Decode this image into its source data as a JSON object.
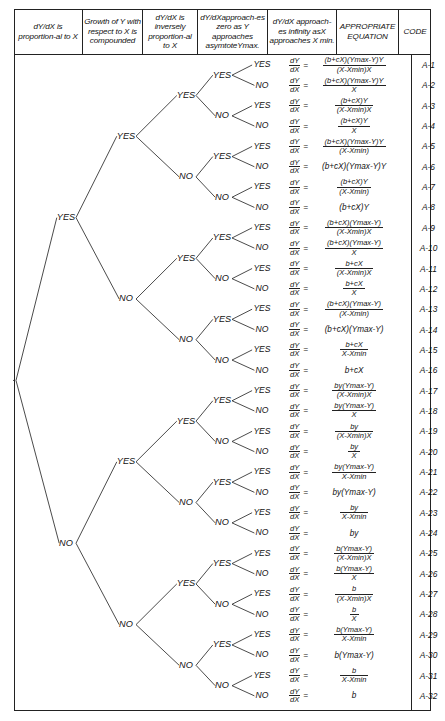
{
  "headers": [
    {
      "id": "col-proportional-to-x",
      "text": "dY/dX is proportion-al to X"
    },
    {
      "id": "col-compounded",
      "text": "Growth of Y with respect to X is compounded"
    },
    {
      "id": "col-inversely-proportional",
      "text": "dY/dX is inversely proportion-al to X"
    },
    {
      "id": "col-approaches-zero",
      "text": "dY/dXapproach-es zero as Y approaches asymtoteYmax."
    },
    {
      "id": "col-approaches-infinity",
      "text": "dY/dX approach-es infinity asX approaches X min."
    },
    {
      "id": "col-equation",
      "text": "APPROPRIATE EQUATION"
    },
    {
      "id": "col-code",
      "text": "CODE"
    }
  ],
  "labels": {
    "yes": "YES",
    "no": "NO",
    "dY": "dY",
    "dX": "dX",
    "equals": "="
  },
  "rows": [
    {
      "code": "A-1",
      "leaf": "YES",
      "eq": [
        {
          "t": "frac",
          "n": "(b+cX)(Ymax-Y)Y",
          "d": "(X-Xmin)X"
        }
      ]
    },
    {
      "code": "A-2",
      "leaf": "NO",
      "eq": [
        {
          "t": "frac",
          "n": "(b+cX)(Ymax-Y)Y",
          "d": "X"
        }
      ]
    },
    {
      "code": "A-3",
      "leaf": "YES",
      "eq": [
        {
          "t": "frac",
          "n": "(b+cX)Y",
          "d": "(X-Xmin)X"
        }
      ]
    },
    {
      "code": "A-4",
      "leaf": "NO",
      "eq": [
        {
          "t": "frac",
          "n": "(b+cX)Y",
          "d": "X"
        }
      ]
    },
    {
      "code": "A-5",
      "leaf": "YES",
      "eq": [
        {
          "t": "frac",
          "n": "(b+cX)(Ymax-Y)Y",
          "d": "(X-Xmin)"
        }
      ]
    },
    {
      "code": "A-6",
      "leaf": "NO",
      "eq": [
        {
          "t": "plain",
          "v": "(b+cX)(Ymax-Y)Y"
        }
      ]
    },
    {
      "code": "A-7",
      "leaf": "YES",
      "eq": [
        {
          "t": "frac",
          "n": "(b+cX)Y",
          "d": "(X-Xmin)"
        }
      ]
    },
    {
      "code": "A-8",
      "leaf": "NO",
      "eq": [
        {
          "t": "plain",
          "v": "(b+cX)Y"
        }
      ]
    },
    {
      "code": "A-9",
      "leaf": "YES",
      "eq": [
        {
          "t": "frac",
          "n": "(b+cX)(Ymax-Y)",
          "d": "(X-Xmin)X"
        }
      ]
    },
    {
      "code": "A-10",
      "leaf": "NO",
      "eq": [
        {
          "t": "frac",
          "n": "(b+cX)(Ymax-Y)",
          "d": "X"
        }
      ]
    },
    {
      "code": "A-11",
      "leaf": "YES",
      "eq": [
        {
          "t": "frac",
          "n": "b+cX",
          "d": "(X-Xmin)X"
        }
      ]
    },
    {
      "code": "A-12",
      "leaf": "NO",
      "eq": [
        {
          "t": "frac",
          "n": "b+cX",
          "d": "X"
        }
      ]
    },
    {
      "code": "A-13",
      "leaf": "YES",
      "eq": [
        {
          "t": "frac",
          "n": "(b+cX)(Ymax-Y)",
          "d": "(X-Xmin)"
        }
      ]
    },
    {
      "code": "A-14",
      "leaf": "NO",
      "eq": [
        {
          "t": "plain",
          "v": "(b+cX)(Ymax-Y)"
        }
      ]
    },
    {
      "code": "A-15",
      "leaf": "YES",
      "eq": [
        {
          "t": "frac",
          "n": "b+cX",
          "d": "X-Xmin"
        }
      ]
    },
    {
      "code": "A-16",
      "leaf": "NO",
      "eq": [
        {
          "t": "plain",
          "v": "b+cX"
        }
      ]
    },
    {
      "code": "A-17",
      "leaf": "YES",
      "eq": [
        {
          "t": "frac",
          "n": "by(Ymax-Y)",
          "d": "(X-Xmin)X"
        }
      ]
    },
    {
      "code": "A-18",
      "leaf": "NO",
      "eq": [
        {
          "t": "frac",
          "n": "by(Ymax-Y)",
          "d": "X"
        }
      ]
    },
    {
      "code": "A-19",
      "leaf": "YES",
      "eq": [
        {
          "t": "frac",
          "n": "by",
          "d": "(X-Xmin)X"
        }
      ]
    },
    {
      "code": "A-20",
      "leaf": "NO",
      "eq": [
        {
          "t": "frac",
          "n": "by",
          "d": "X"
        }
      ]
    },
    {
      "code": "A-21",
      "leaf": "YES",
      "eq": [
        {
          "t": "frac",
          "n": "by(Ymax-Y)",
          "d": "X-Xmin"
        }
      ]
    },
    {
      "code": "A-22",
      "leaf": "NO",
      "eq": [
        {
          "t": "plain",
          "v": "by(Ymax-Y)"
        }
      ]
    },
    {
      "code": "A-23",
      "leaf": "YES",
      "eq": [
        {
          "t": "frac",
          "n": "by",
          "d": "X-Xmin"
        }
      ]
    },
    {
      "code": "A-24",
      "leaf": "NO",
      "eq": [
        {
          "t": "plain",
          "v": "by"
        }
      ]
    },
    {
      "code": "A-25",
      "leaf": "YES",
      "eq": [
        {
          "t": "frac",
          "n": "b(Ymax-Y)",
          "d": "(X-Xmin)X"
        }
      ]
    },
    {
      "code": "A-26",
      "leaf": "NO",
      "eq": [
        {
          "t": "frac",
          "n": "b(Ymax-Y)",
          "d": "X"
        }
      ]
    },
    {
      "code": "A-27",
      "leaf": "YES",
      "eq": [
        {
          "t": "frac",
          "n": "b",
          "d": "(X-Xmin)X"
        }
      ]
    },
    {
      "code": "A-28",
      "leaf": "NO",
      "eq": [
        {
          "t": "frac",
          "n": "b",
          "d": "X"
        }
      ]
    },
    {
      "code": "A-29",
      "leaf": "YES",
      "eq": [
        {
          "t": "frac",
          "n": "b(Ymax-Y)",
          "d": "X-Xmin"
        }
      ]
    },
    {
      "code": "A-30",
      "leaf": "NO",
      "eq": [
        {
          "t": "plain",
          "v": "b(Ymax-Y)"
        }
      ]
    },
    {
      "code": "A-31",
      "leaf": "YES",
      "eq": [
        {
          "t": "frac",
          "n": "b",
          "d": "X-Xmin"
        }
      ]
    },
    {
      "code": "A-32",
      "leaf": "NO",
      "eq": [
        {
          "t": "plain",
          "v": "b"
        }
      ]
    }
  ],
  "tree": {
    "note": "5 binary decision levels; level-1 splits on column 1, level-5 leaf labels belong to column 5",
    "level1": [
      "YES",
      "NO"
    ],
    "level2": [
      "YES",
      "NO",
      "YES",
      "NO"
    ],
    "level3": [
      "YES",
      "NO",
      "YES",
      "NO",
      "YES",
      "NO",
      "YES",
      "NO"
    ],
    "level4": [
      "YES",
      "NO",
      "YES",
      "NO",
      "YES",
      "NO",
      "YES",
      "NO",
      "YES",
      "NO",
      "YES",
      "NO",
      "YES",
      "NO",
      "YES",
      "NO"
    ]
  },
  "colors": {
    "ink": "#2a2a2a",
    "background": "#ffffff",
    "border": "#222222"
  }
}
